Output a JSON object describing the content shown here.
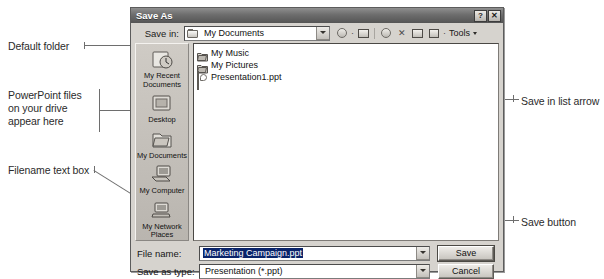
{
  "dialog": {
    "title": "Save As",
    "titlebar_buttons": [
      {
        "name": "help-button",
        "glyph": "?"
      },
      {
        "name": "close-button",
        "glyph": "✕"
      }
    ],
    "save_in": {
      "label": "Save in:",
      "value": "My Documents"
    },
    "toolbar": {
      "tools_label": "Tools",
      "items": [
        {
          "name": "back-icon"
        },
        {
          "name": "up-one-level-icon"
        },
        {
          "name": "search-web-icon"
        },
        {
          "name": "delete-icon"
        },
        {
          "name": "new-folder-icon"
        },
        {
          "name": "views-icon"
        }
      ]
    },
    "places_bar": [
      {
        "label": "My Recent\nDocuments",
        "icon": "recent-documents-icon"
      },
      {
        "label": "Desktop",
        "icon": "desktop-icon"
      },
      {
        "label": "My Documents",
        "icon": "my-documents-icon"
      },
      {
        "label": "My Computer",
        "icon": "my-computer-icon"
      },
      {
        "label": "My Network\nPlaces",
        "icon": "network-places-icon"
      }
    ],
    "file_list": [
      {
        "name": "My Music",
        "icon": "folder-icon"
      },
      {
        "name": "My Pictures",
        "icon": "folder-icon"
      },
      {
        "name": "Presentation1.ppt",
        "icon": "powerpoint-file-icon"
      }
    ],
    "file_name": {
      "label": "File name:",
      "value": "Marketing Campaign.ppt"
    },
    "save_as_type": {
      "label": "Save as type:",
      "value": "Presentation (*.ppt)"
    },
    "buttons": {
      "save": "Save",
      "cancel": "Cancel"
    }
  },
  "annotations": {
    "default_folder": "Default folder",
    "powerpoint_files": "PowerPoint files\non your drive\nappear here",
    "filename_text_box": "Filename text box",
    "save_in_list_arrow": "Save in list arrow",
    "save_button": "Save button"
  },
  "colors": {
    "selection_blue": "#0a246a",
    "dialog_face": "#d6d3ce",
    "title_bar": "#6d6d6d",
    "annotation_text": "#2b2b2b",
    "leader_line": "#6e6e6e"
  }
}
